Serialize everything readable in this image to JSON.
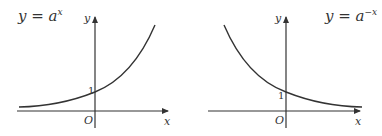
{
  "panels": [
    {
      "title_base": "y = a",
      "title_exp": "x",
      "y_axis_label": "y",
      "x_axis_label": "x",
      "origin_label": "O",
      "intercept_label": "1"
    },
    {
      "title_base": "y = a",
      "title_exp": "−x",
      "y_axis_label": "y",
      "x_axis_label": "x",
      "origin_label": "O",
      "intercept_label": "1"
    }
  ],
  "colors": {
    "stroke": "#333333",
    "background": "#ffffff"
  }
}
